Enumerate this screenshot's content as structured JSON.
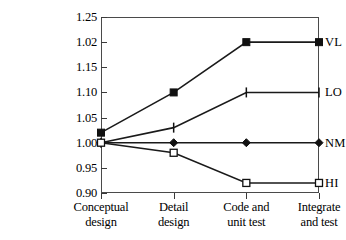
{
  "chart_data": {
    "type": "line",
    "title": "",
    "xlabel": "",
    "ylabel": "",
    "grid": false,
    "legend_position": "right-of-axis",
    "categories": [
      "Conceptual design",
      "Detail design",
      "Code and unit test",
      "Integrate and test"
    ],
    "category_lines": [
      [
        "Conceptual",
        "design"
      ],
      [
        "Detail",
        "design"
      ],
      [
        "Code and",
        "unit test"
      ],
      [
        "Integrate",
        "and test"
      ]
    ],
    "y_tick_labels": [
      "1.25",
      "1.02",
      "1.15",
      "1.10",
      "1.05",
      "1.00",
      "0.95",
      "0.90"
    ],
    "ylim": [
      0.9,
      1.25
    ],
    "series": [
      {
        "name": "VL",
        "label": "VL",
        "marker": "filled-square",
        "values": [
          1.02,
          1.1,
          1.2,
          1.2
        ]
      },
      {
        "name": "LO",
        "label": "LO",
        "marker": "tick-bar",
        "values": [
          1.0,
          1.03,
          1.1,
          1.1
        ]
      },
      {
        "name": "NM",
        "label": "NM",
        "marker": "filled-diamond",
        "values": [
          1.0,
          1.0,
          1.0,
          1.0
        ]
      },
      {
        "name": "HI",
        "label": "HI",
        "marker": "open-square",
        "values": [
          1.0,
          0.98,
          0.92,
          0.92
        ]
      }
    ],
    "colors": {
      "line": "#1a1a1a",
      "axis": "#4a4a4a",
      "background": "#ffffff"
    }
  }
}
